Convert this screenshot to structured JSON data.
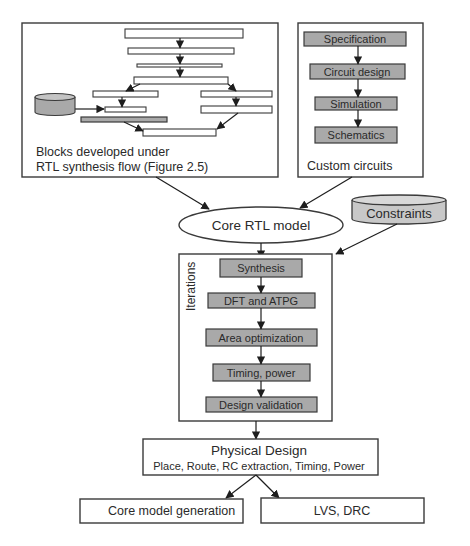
{
  "diagram": {
    "left_panel": {
      "caption_line1": "Blocks developed under",
      "caption_line2": "RTL synthesis flow (Figure 2.5)"
    },
    "custom_panel": {
      "steps": [
        "Specification",
        "Circuit design",
        "Simulation",
        "Schematics"
      ],
      "caption": "Custom circuits"
    },
    "core_rtl": {
      "label": "Core RTL model"
    },
    "constraints": {
      "label": "Constraints"
    },
    "iterations": {
      "label": "Iterations",
      "steps": [
        "Synthesis",
        "DFT and ATPG",
        "Area optimization",
        "Timing, power",
        "Design validation"
      ]
    },
    "physical_design": {
      "title": "Physical Design",
      "subtitle": "Place, Route, RC extraction, Timing, Power"
    },
    "outputs": {
      "core_model": "Core model generation",
      "lvs_drc": "LVS, DRC"
    },
    "colors": {
      "box_fill": "#a9a9a9",
      "stroke": "#3a3a3a",
      "background": "#ffffff"
    }
  }
}
